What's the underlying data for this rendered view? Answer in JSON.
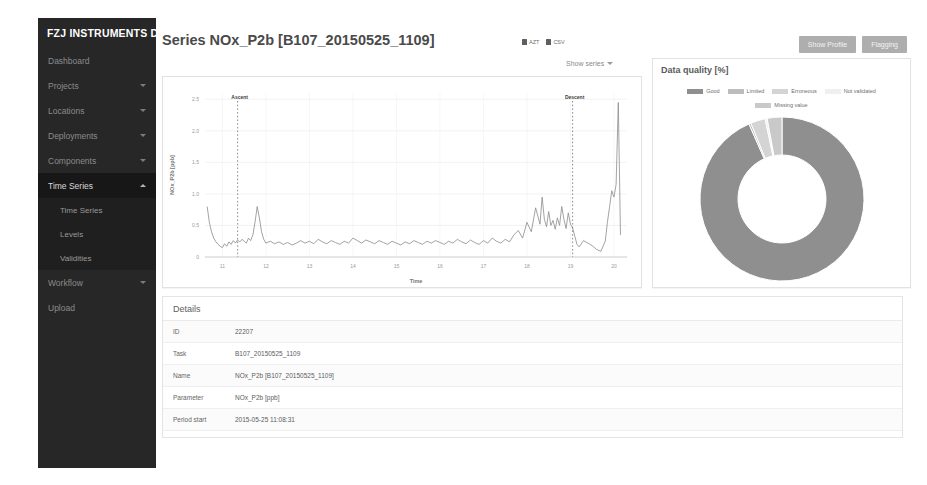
{
  "app": {
    "brand": "FZJ INSTRUMENTS DB"
  },
  "sidebar": {
    "items": [
      {
        "label": "Dashboard",
        "caret": false,
        "active": false
      },
      {
        "label": "Projects",
        "caret": true,
        "active": false
      },
      {
        "label": "Locations",
        "caret": true,
        "active": false
      },
      {
        "label": "Deployments",
        "caret": true,
        "active": false
      },
      {
        "label": "Components",
        "caret": true,
        "active": false
      },
      {
        "label": "Time Series",
        "caret": true,
        "active": true
      },
      {
        "label": "Workflow",
        "caret": true,
        "active": false
      },
      {
        "label": "Upload",
        "caret": false,
        "active": false
      }
    ],
    "submenu": [
      {
        "label": "Time Series"
      },
      {
        "label": "Levels"
      },
      {
        "label": "Validities"
      }
    ]
  },
  "header": {
    "title": "Series NOx_P2b [B107_20150525_1109]",
    "links": [
      {
        "label": "AZT",
        "icon": "file-download-icon"
      },
      {
        "label": "CSV",
        "icon": "file-download-icon"
      }
    ],
    "buttons": [
      {
        "label": "Show Profile"
      },
      {
        "label": "Flagging"
      }
    ]
  },
  "chart_panel": {
    "show_series_label": "Show series",
    "chevron": "chevron-down-icon"
  },
  "quality_panel": {
    "title": "Data quality [%]"
  },
  "details": {
    "heading": "Details",
    "rows": [
      {
        "key": "ID",
        "value": "22207"
      },
      {
        "key": "Task",
        "value": "B107_20150525_1109"
      },
      {
        "key": "Name",
        "value": "NOx_P2b [B107_20150525_1109]"
      },
      {
        "key": "Parameter",
        "value": "NOx_P2b [ppb]"
      },
      {
        "key": "Period start",
        "value": "2015-05-25 11:08:31"
      }
    ]
  },
  "chart_data": [
    {
      "id": "timeseries",
      "type": "line",
      "title": "",
      "xlabel": "Time",
      "ylabel": "NOx_P2b [ppb]",
      "xlim": [
        10.6,
        20.3
      ],
      "ylim": [
        0,
        2.6
      ],
      "xticks": [
        11,
        12,
        13,
        14,
        15,
        16,
        17,
        18,
        19,
        20
      ],
      "yticks": [
        0,
        0.5,
        1.0,
        1.5,
        2.0,
        2.5
      ],
      "grid": true,
      "legend": "none",
      "line_color": "#8c8c8c",
      "annotations": [
        {
          "label": "Ascent",
          "x": 11.35,
          "style": "dashed-vline"
        },
        {
          "label": "Descent",
          "x": 19.05,
          "style": "dashed-vline"
        }
      ],
      "x": [
        10.65,
        10.7,
        10.75,
        10.8,
        10.85,
        10.9,
        10.95,
        11.0,
        11.05,
        11.1,
        11.15,
        11.2,
        11.25,
        11.3,
        11.35,
        11.4,
        11.45,
        11.5,
        11.55,
        11.6,
        11.65,
        11.7,
        11.75,
        11.8,
        11.85,
        11.9,
        11.95,
        12.0,
        12.1,
        12.2,
        12.3,
        12.4,
        12.5,
        12.6,
        12.7,
        12.8,
        12.9,
        13.0,
        13.1,
        13.2,
        13.3,
        13.4,
        13.5,
        13.6,
        13.7,
        13.8,
        13.9,
        14.0,
        14.1,
        14.2,
        14.3,
        14.4,
        14.5,
        14.6,
        14.7,
        14.8,
        14.9,
        15.0,
        15.1,
        15.2,
        15.3,
        15.4,
        15.5,
        15.6,
        15.7,
        15.8,
        15.9,
        16.0,
        16.1,
        16.2,
        16.3,
        16.4,
        16.5,
        16.6,
        16.7,
        16.8,
        16.9,
        17.0,
        17.1,
        17.2,
        17.3,
        17.4,
        17.5,
        17.6,
        17.7,
        17.8,
        17.9,
        18.0,
        18.1,
        18.2,
        18.3,
        18.35,
        18.4,
        18.45,
        18.5,
        18.55,
        18.6,
        18.65,
        18.7,
        18.75,
        18.8,
        18.85,
        18.9,
        18.95,
        19.0,
        19.05,
        19.1,
        19.15,
        19.2,
        19.3,
        19.4,
        19.5,
        19.6,
        19.7,
        19.8,
        19.85,
        19.9,
        19.95,
        20.0,
        20.05,
        20.1,
        20.15
      ],
      "y": [
        0.8,
        0.55,
        0.4,
        0.3,
        0.24,
        0.2,
        0.17,
        0.15,
        0.21,
        0.17,
        0.24,
        0.2,
        0.26,
        0.22,
        0.27,
        0.24,
        0.28,
        0.25,
        0.22,
        0.3,
        0.26,
        0.35,
        0.55,
        0.8,
        0.62,
        0.4,
        0.28,
        0.22,
        0.25,
        0.21,
        0.24,
        0.2,
        0.23,
        0.19,
        0.22,
        0.26,
        0.22,
        0.25,
        0.21,
        0.28,
        0.24,
        0.21,
        0.26,
        0.23,
        0.2,
        0.25,
        0.22,
        0.3,
        0.26,
        0.22,
        0.27,
        0.24,
        0.21,
        0.26,
        0.23,
        0.2,
        0.25,
        0.22,
        0.19,
        0.24,
        0.21,
        0.26,
        0.23,
        0.2,
        0.25,
        0.22,
        0.26,
        0.23,
        0.2,
        0.25,
        0.22,
        0.28,
        0.24,
        0.21,
        0.27,
        0.23,
        0.2,
        0.26,
        0.22,
        0.3,
        0.25,
        0.22,
        0.28,
        0.24,
        0.35,
        0.42,
        0.3,
        0.55,
        0.4,
        0.78,
        0.52,
        0.95,
        0.6,
        0.48,
        0.72,
        0.5,
        0.58,
        0.44,
        0.62,
        0.5,
        0.8,
        0.6,
        0.45,
        0.7,
        0.52,
        0.46,
        0.33,
        0.2,
        0.16,
        0.26,
        0.22,
        0.18,
        0.12,
        0.09,
        0.25,
        0.55,
        0.8,
        1.05,
        0.95,
        1.15,
        2.45,
        0.35
      ]
    },
    {
      "id": "data-quality-donut",
      "type": "pie",
      "title": "Data quality [%]",
      "donut": true,
      "legend": "top",
      "labels": [
        "Good",
        "Limited",
        "Erroneous",
        "Not validated",
        "Missing value"
      ],
      "values": [
        93.4,
        0.4,
        2.9,
        0.4,
        2.9
      ],
      "colors": [
        "#8f8f8f",
        "#bdbdbd",
        "#d4d4d4",
        "#efefef",
        "#c9c9c9"
      ]
    }
  ]
}
